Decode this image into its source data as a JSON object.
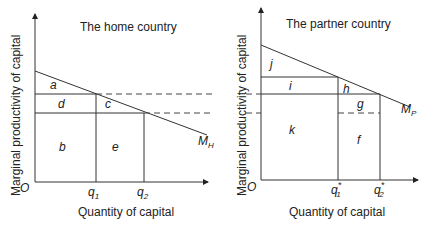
{
  "home": {
    "title": "The home country",
    "ylabel": "Marginal productivity of capital",
    "xlabel": "Quantity of capital",
    "origin": "O",
    "curve_label_main": "M",
    "curve_label_sub": "H",
    "q1_main": "q",
    "q1_sub": "1",
    "q2_main": "q",
    "q2_sub": "2",
    "areas": {
      "a": "a",
      "b": "b",
      "c": "c",
      "d": "d",
      "e": "e"
    }
  },
  "partner": {
    "title": "The partner country",
    "ylabel": "Marginal productivity of capital",
    "xlabel": "Quantity of capital",
    "origin": "O",
    "curve_label_main": "M",
    "curve_label_sub": "P",
    "q1_main": "q",
    "q1_sub": "1",
    "q1_sup": "*",
    "q2_main": "q",
    "q2_sub": "2",
    "q2_sup": "*",
    "areas": {
      "f": "f",
      "g": "g",
      "h": "h",
      "i": "i",
      "j": "j",
      "k": "k"
    }
  },
  "colors": {
    "line": "#333333",
    "text": "#222222",
    "background": "#ffffff"
  }
}
